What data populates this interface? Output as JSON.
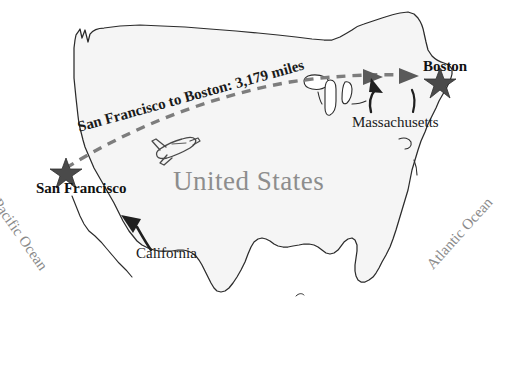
{
  "map": {
    "title": "United States",
    "country_label": "United States",
    "background_color": "#ffffff",
    "landmass_fill": "#f5f5f5",
    "outline_color": "#2b2b2b",
    "label_gray": "#8a8a8a",
    "route_color": "#7a7a7a",
    "star_color": "#4a4a4a"
  },
  "oceans": [
    {
      "name": "pacific",
      "label": "Pacific Ocean"
    },
    {
      "name": "atlantic",
      "label": "Atlantic Ocean"
    }
  ],
  "cities": [
    {
      "name": "san-francisco",
      "label": "San Francisco",
      "marker": "star"
    },
    {
      "name": "boston",
      "label": "Boston",
      "marker": "star"
    }
  ],
  "states": [
    {
      "name": "california",
      "label": "California",
      "pointer": "curved-arrow"
    },
    {
      "name": "massachusetts",
      "label": "Massachusetts",
      "pointer": "curved-arrow"
    }
  ],
  "route": {
    "label": "San Francisco to Boston: 3,179 miles",
    "origin": "San Francisco",
    "destination": "Boston",
    "distance_value": "3,179",
    "distance_unit": "miles",
    "line_style": "dashed",
    "arrow_head": "right"
  },
  "icons": {
    "airplane": "airplane-icon",
    "star": "star-icon",
    "arrow": "arrow-icon"
  }
}
